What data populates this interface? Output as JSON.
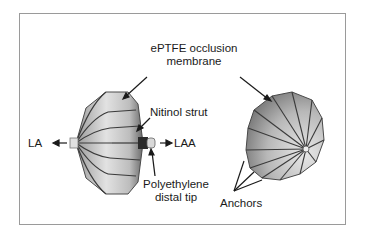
{
  "figure": {
    "labels": {
      "membrane_line1": "ePTFE occlusion",
      "membrane_line2": "membrane",
      "nitinol": "Nitinol strut",
      "la": "LA",
      "laa": "LAA",
      "tip_line1": "Polyethylene",
      "tip_line2": "distal tip",
      "anchors": "Anchors"
    },
    "colors": {
      "border": "#9a9a9a",
      "text": "#1a1a1a",
      "device_fill": "#c8c8c8",
      "device_shadow": "#8a8a8a",
      "strut": "#3a3a3a"
    }
  }
}
